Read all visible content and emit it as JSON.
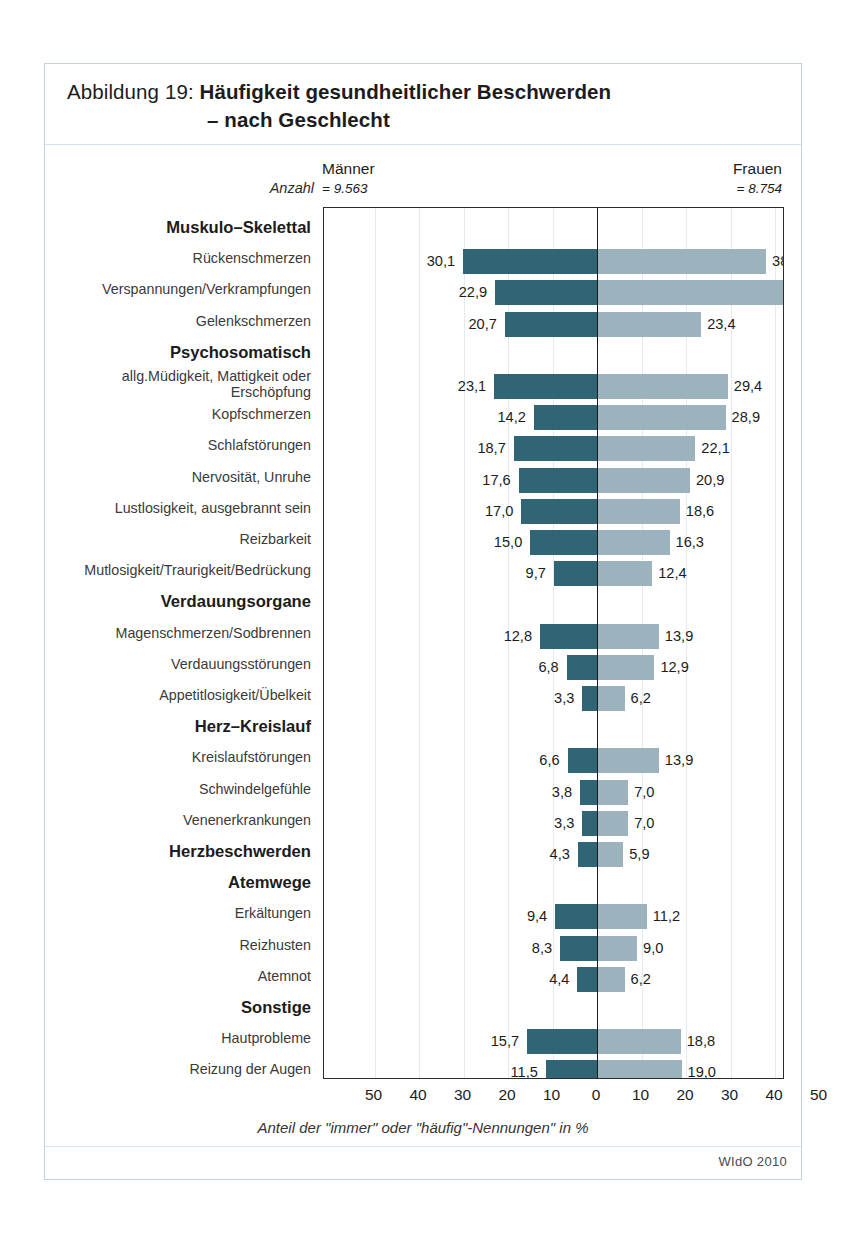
{
  "figure": {
    "title_prefix": "Abbildung 19: ",
    "title_line1": "Häufigkeit gesundheitlicher Beschwerden",
    "title_line2": "– nach Geschlecht",
    "source": "WIdO 2010"
  },
  "header": {
    "anzahl_label": "Anzahl",
    "left_group": "Männer",
    "left_count": "= 9.563",
    "right_group": "Frauen",
    "right_count": "= 8.754"
  },
  "axis": {
    "caption": "Anteil der \"immer\" oder \"häufig\"-Nennungen\" in %",
    "ticks": [
      "50",
      "40",
      "30",
      "20",
      "10",
      "0",
      "10",
      "20",
      "30",
      "40",
      "50"
    ],
    "tick_positions": [
      -50,
      -40,
      -30,
      -20,
      -10,
      0,
      10,
      20,
      30,
      40,
      50
    ]
  },
  "chart_data": {
    "type": "bar",
    "orientation": "horizontal-diverging",
    "title": "Abbildung 19: Häufigkeit gesundheitlicher Beschwerden – nach Geschlecht",
    "xlabel": "Anteil der \"immer\" oder \"häufig\"-Nennungen\" in %",
    "ylabel": "",
    "xlim": [
      -50,
      50
    ],
    "grid": true,
    "legend_position": "top",
    "series": [
      {
        "name": "Männer",
        "n": 9563,
        "color": "#2f6575",
        "side": "left"
      },
      {
        "name": "Frauen",
        "n": 8754,
        "color": "#9cb3bd",
        "side": "right"
      }
    ],
    "rows": [
      {
        "kind": "section",
        "label": "Muskulo–Skelettal"
      },
      {
        "kind": "data",
        "label": "Rückenschmerzen",
        "maenner": 30.1,
        "frauen": 38.0,
        "maenner_text": "30,1",
        "frauen_text": "38,0"
      },
      {
        "kind": "data",
        "label": "Verspannungen/Verkrampfungen",
        "maenner": 22.9,
        "frauen": 42.1,
        "maenner_text": "22,9",
        "frauen_text": "42,1"
      },
      {
        "kind": "data",
        "label": "Gelenkschmerzen",
        "maenner": 20.7,
        "frauen": 23.4,
        "maenner_text": "20,7",
        "frauen_text": "23,4"
      },
      {
        "kind": "section",
        "label": "Psychosomatisch"
      },
      {
        "kind": "data",
        "label": "allg.Müdigkeit, Mattigkeit oder Erschöpfung",
        "maenner": 23.1,
        "frauen": 29.4,
        "maenner_text": "23,1",
        "frauen_text": "29,4",
        "twoline": true
      },
      {
        "kind": "data",
        "label": "Kopfschmerzen",
        "maenner": 14.2,
        "frauen": 28.9,
        "maenner_text": "14,2",
        "frauen_text": "28,9"
      },
      {
        "kind": "data",
        "label": "Schlafstörungen",
        "maenner": 18.7,
        "frauen": 22.1,
        "maenner_text": "18,7",
        "frauen_text": "22,1"
      },
      {
        "kind": "data",
        "label": "Nervosität, Unruhe",
        "maenner": 17.6,
        "frauen": 20.9,
        "maenner_text": "17,6",
        "frauen_text": "20,9"
      },
      {
        "kind": "data",
        "label": "Lustlosigkeit, ausgebrannt sein",
        "maenner": 17.0,
        "frauen": 18.6,
        "maenner_text": "17,0",
        "frauen_text": "18,6"
      },
      {
        "kind": "data",
        "label": "Reizbarkeit",
        "maenner": 15.0,
        "frauen": 16.3,
        "maenner_text": "15,0",
        "frauen_text": "16,3"
      },
      {
        "kind": "data",
        "label": "Mutlosigkeit/Traurigkeit/Bedrückung",
        "maenner": 9.7,
        "frauen": 12.4,
        "maenner_text": "9,7",
        "frauen_text": "12,4"
      },
      {
        "kind": "section",
        "label": "Verdauungsorgane"
      },
      {
        "kind": "data",
        "label": "Magenschmerzen/Sodbrennen",
        "maenner": 12.8,
        "frauen": 13.9,
        "maenner_text": "12,8",
        "frauen_text": "13,9"
      },
      {
        "kind": "data",
        "label": "Verdauungsstörungen",
        "maenner": 6.8,
        "frauen": 12.9,
        "maenner_text": "6,8",
        "frauen_text": "12,9"
      },
      {
        "kind": "data",
        "label": "Appetitlosigkeit/Übelkeit",
        "maenner": 3.3,
        "frauen": 6.2,
        "maenner_text": "3,3",
        "frauen_text": "6,2"
      },
      {
        "kind": "section",
        "label": "Herz–Kreislauf"
      },
      {
        "kind": "data",
        "label": "Kreislaufstörungen",
        "maenner": 6.6,
        "frauen": 13.9,
        "maenner_text": "6,6",
        "frauen_text": "13,9"
      },
      {
        "kind": "data",
        "label": "Schwindelgefühle",
        "maenner": 3.8,
        "frauen": 7.0,
        "maenner_text": "3,8",
        "frauen_text": "7,0"
      },
      {
        "kind": "data",
        "label": "Venenerkrankungen",
        "maenner": 3.3,
        "frauen": 7.0,
        "maenner_text": "3,3",
        "frauen_text": "7,0"
      },
      {
        "kind": "data",
        "label": "Herzbeschwerden",
        "maenner": 4.3,
        "frauen": 5.9,
        "maenner_text": "4,3",
        "frauen_text": "5,9",
        "bold": true
      },
      {
        "kind": "section",
        "label": "Atemwege"
      },
      {
        "kind": "data",
        "label": "Erkältungen",
        "maenner": 9.4,
        "frauen": 11.2,
        "maenner_text": "9,4",
        "frauen_text": "11,2"
      },
      {
        "kind": "data",
        "label": "Reizhusten",
        "maenner": 8.3,
        "frauen": 9.0,
        "maenner_text": "8,3",
        "frauen_text": "9,0"
      },
      {
        "kind": "data",
        "label": "Atemnot",
        "maenner": 4.4,
        "frauen": 6.2,
        "maenner_text": "4,4",
        "frauen_text": "6,2"
      },
      {
        "kind": "section",
        "label": "Sonstige"
      },
      {
        "kind": "data",
        "label": "Hautprobleme",
        "maenner": 15.7,
        "frauen": 18.8,
        "maenner_text": "15,7",
        "frauen_text": "18,8"
      },
      {
        "kind": "data",
        "label": "Reizung der Augen",
        "maenner": 11.5,
        "frauen": 19.0,
        "maenner_text": "11,5",
        "frauen_text": "19,0"
      }
    ]
  }
}
